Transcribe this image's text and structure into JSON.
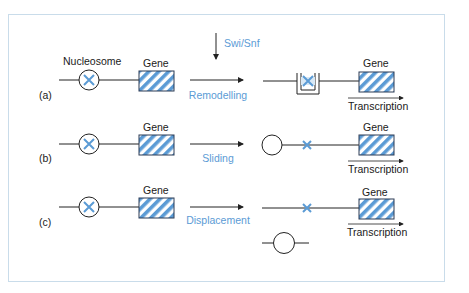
{
  "colors": {
    "frame": "#c9dcea",
    "accent_blue": "#5b9bd5",
    "stripe_blue": "#5b9bd5",
    "line": "#222222"
  },
  "enzyme": {
    "label": "Swi/Snf"
  },
  "labels": {
    "nucleosome": "Nucleosome",
    "gene": "Gene",
    "transcription": "Transcription"
  },
  "rows": [
    {
      "id": "a",
      "tag": "(a)",
      "process": "Remodelling",
      "result": "remodelled-nucleosome"
    },
    {
      "id": "b",
      "tag": "(b)",
      "process": "Sliding",
      "result": "nucleosome-slid-away"
    },
    {
      "id": "c",
      "tag": "(c)",
      "process": "Displacement",
      "result": "nucleosome-displaced"
    }
  ],
  "icons": {
    "nucleosome": "circle-with-x-icon",
    "gene": "hatched-box-icon",
    "arrow": "right-arrow-icon",
    "down_arrow": "down-arrow-icon"
  }
}
